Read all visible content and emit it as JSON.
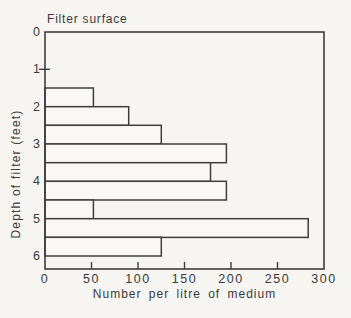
{
  "chart_data": {
    "type": "bar",
    "orientation": "horizontal",
    "annotation": "Filter surface",
    "xlabel": "Number per litre of medium",
    "ylabel": "Depth of filter (feet)",
    "xlim": [
      0,
      300
    ],
    "x_ticks": [
      0,
      50,
      100,
      150,
      200,
      250,
      300
    ],
    "depth_ticks": [
      0,
      1,
      2,
      3,
      4,
      5,
      6
    ],
    "depth_axis_max_feet": 6.35,
    "bar_interval_feet": 0.5,
    "grid": false,
    "legend": false,
    "bars": [
      {
        "depth_from": 1.5,
        "depth_to": 2.0,
        "value": 52
      },
      {
        "depth_from": 2.0,
        "depth_to": 2.5,
        "value": 90
      },
      {
        "depth_from": 2.5,
        "depth_to": 3.0,
        "value": 125
      },
      {
        "depth_from": 3.0,
        "depth_to": 3.5,
        "value": 195
      },
      {
        "depth_from": 3.5,
        "depth_to": 4.0,
        "value": 178
      },
      {
        "depth_from": 4.0,
        "depth_to": 4.5,
        "value": 195
      },
      {
        "depth_from": 4.5,
        "depth_to": 5.0,
        "value": 52
      },
      {
        "depth_from": 5.0,
        "depth_to": 5.5,
        "value": 283
      },
      {
        "depth_from": 5.5,
        "depth_to": 6.0,
        "value": 125
      }
    ],
    "colors": {
      "line": "#3e3e3e",
      "text": "#3a3a3a",
      "background": "#f6f5f2",
      "bar_fill": "#f9f8f6"
    }
  }
}
